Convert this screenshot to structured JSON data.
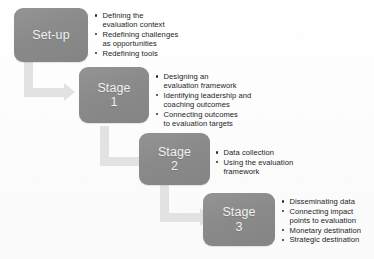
{
  "diagram": {
    "colors": {
      "box_fill": "#8d8d8d",
      "box_text": "#f0f0f0",
      "arrow_fill": "#e2e2e2",
      "bullet_text": "#242424",
      "background": "#fdfdfd"
    },
    "steps": [
      {
        "id": "set-up",
        "box_label": "Set-up",
        "bullets": [
          "Defining the\nevaluation context",
          "Redefining challenges\nas opportunities",
          "Redefining tools"
        ]
      },
      {
        "id": "stage-1",
        "box_label": "Stage\n1",
        "bullets": [
          "Designing an\nevaluation framework",
          "Identifying leadership and\ncoaching outcomes",
          "Connecting outcomes\nto evaluation targets"
        ]
      },
      {
        "id": "stage-2",
        "box_label": "Stage\n2",
        "bullets": [
          "Data collection",
          "Using the evaluation\nframework"
        ]
      },
      {
        "id": "stage-3",
        "box_label": "Stage\n3",
        "bullets": [
          "Disseminating data",
          "Connecting impact\npoints to evaluation",
          "Monetary destination",
          "Strategic destination"
        ]
      }
    ],
    "connectors": [
      {
        "id": "arrow-setup-to-stage1",
        "from": "set-up",
        "to": "stage-1",
        "shape": "elbow-down-right"
      },
      {
        "id": "arrow-stage1-to-stage2",
        "from": "stage-1",
        "to": "stage-2",
        "shape": "elbow-down-right"
      },
      {
        "id": "arrow-stage2-to-stage3",
        "from": "stage-2",
        "to": "stage-3",
        "shape": "elbow-down-right"
      }
    ]
  }
}
